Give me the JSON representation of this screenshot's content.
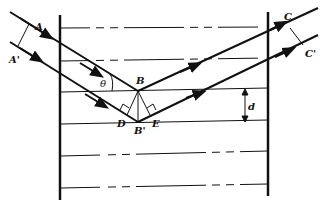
{
  "diagram": {
    "labels": {
      "A": "A",
      "A_prime": "A'",
      "B": "B",
      "B_prime": "B'",
      "C": "C",
      "C_prime": "C'",
      "D": "D",
      "E": "E",
      "theta": "θ",
      "d": "d"
    },
    "planes_count": 6,
    "colors": {
      "line": "#111111",
      "background": "#ffffff"
    }
  }
}
